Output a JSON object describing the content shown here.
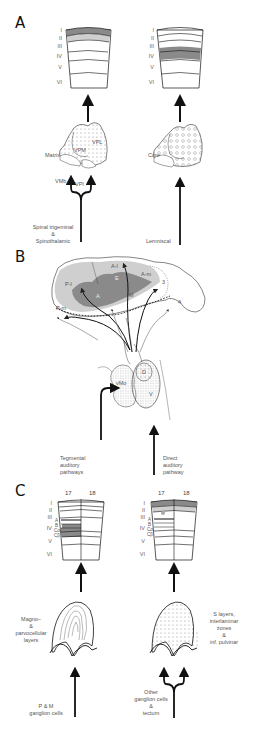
{
  "panels": {
    "A": {
      "letter": "A",
      "left_column": {
        "layers": [
          "I",
          "II",
          "III",
          "IV",
          "V",
          "VI"
        ],
        "highlighted_layers": [
          "I",
          "II"
        ],
        "thalamus_labels": [
          "Matrix",
          "VPM",
          "VPL",
          "VMb",
          "VPI"
        ],
        "input_label_lines": [
          "Spinal trigeminal",
          "&",
          "Spinothalamic"
        ],
        "input_type": "forked"
      },
      "right_column": {
        "layers": [
          "I",
          "II",
          "III",
          "IV",
          "V",
          "VI"
        ],
        "highlighted_layers": [
          "III",
          "IV"
        ],
        "thalamus_labels": [
          "Core"
        ],
        "input_label_lines": [
          "Lemniscal"
        ],
        "input_type": "single"
      }
    },
    "B": {
      "letter": "B",
      "cortex_labels": [
        "P-l",
        "A-l",
        "A-m",
        "E",
        "M",
        "P-m",
        "3",
        "4",
        "A"
      ],
      "mgn_labels": [
        "vMo",
        "D",
        "V"
      ],
      "left_input_label_lines": [
        "Tegmental",
        "auditory",
        "pathways"
      ],
      "right_input_label_lines": [
        "Direct",
        "auditory",
        "pathway"
      ]
    },
    "C": {
      "letter": "C",
      "left_column": {
        "area_labels": [
          "17",
          "18"
        ],
        "layers": [
          "I",
          "II",
          "III",
          "IV",
          "V",
          "VI"
        ],
        "sublayers": [
          "A",
          "B",
          "Cα",
          "Cβ"
        ],
        "highlighted_layers": [
          "IVc"
        ],
        "lgn_label_lines": [
          "Magno–",
          "&",
          "parvocellular",
          "layers"
        ],
        "input_label_lines": [
          "P & M",
          "ganglion cells"
        ],
        "input_type": "single"
      },
      "right_column": {
        "area_labels": [
          "17",
          "18"
        ],
        "layers": [
          "I",
          "II",
          "III",
          "IV",
          "V",
          "VI"
        ],
        "sublayers": [
          "A",
          "B",
          "Cα",
          "Cβ"
        ],
        "highlighted_layers": [
          "I",
          "II"
        ],
        "lgn_label_lines": [
          "S layers,",
          "interlaminar",
          "zones",
          "&",
          "inf. pulvinar"
        ],
        "input_label_lines": [
          "Other",
          "ganglion cells",
          "&",
          "tectum"
        ],
        "input_type": "forked"
      }
    }
  },
  "colors": {
    "dark_gray": "#8a8a8a",
    "light_gray": "#cfcfcf",
    "mid_gray": "#a8a8a8",
    "line": "#111111",
    "label": "#555555"
  }
}
